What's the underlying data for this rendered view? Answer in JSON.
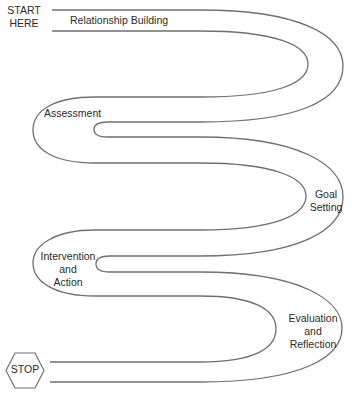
{
  "diagram": {
    "type": "serpentine-road-process",
    "start_label": "START\nHERE",
    "start_lines": [
      "START",
      "HERE"
    ],
    "end_label": "STOP",
    "stages": [
      {
        "id": "relationship-building",
        "lines": [
          "Relationship Building"
        ]
      },
      {
        "id": "assessment",
        "lines": [
          "Assessment"
        ]
      },
      {
        "id": "goal-setting",
        "lines": [
          "Goal",
          "Setting"
        ]
      },
      {
        "id": "intervention-and-action",
        "lines": [
          "Intervention",
          "and",
          "Action"
        ]
      },
      {
        "id": "evaluation-and-reflection",
        "lines": [
          "Evaluation",
          "and",
          "Reflection"
        ]
      }
    ],
    "colors": {
      "line": "#6f6f6f",
      "text": "#2a2a2a",
      "background": "#ffffff"
    }
  }
}
